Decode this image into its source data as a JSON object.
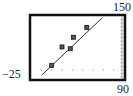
{
  "window": {
    "ymax_label": "150",
    "ymin_label": "−25",
    "xmax_label": "90"
  },
  "chart_data": {
    "type": "scatter",
    "title": "",
    "xlabel": "",
    "ylabel": "",
    "xlim": [
      0,
      90
    ],
    "ylim": [
      -25,
      150
    ],
    "grid": false,
    "legend": null,
    "series": [
      {
        "name": "data points",
        "marker": "square",
        "x": [
          20,
          30,
          38,
          41,
          54
        ],
        "y": [
          13,
          64,
          59,
          91,
          118
        ]
      }
    ],
    "regression_line": {
      "type": "line",
      "x": [
        10,
        69
      ],
      "y": [
        -15,
        145
      ]
    },
    "annotations": [
      "150 (y max)",
      "-25 (y min)",
      "90 (x max)"
    ]
  }
}
